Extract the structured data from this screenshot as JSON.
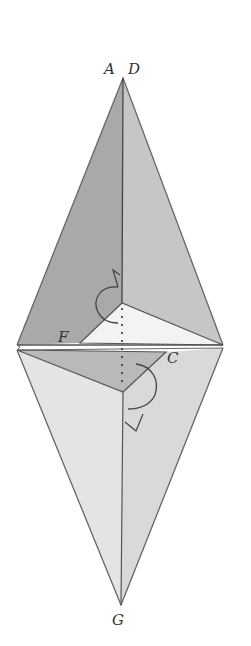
{
  "diagram": {
    "labels": {
      "A": "A",
      "D": "D",
      "F": "F",
      "C": "C",
      "G": "G"
    },
    "colors": {
      "background": "#ffffff",
      "upper_left_face": "#a9a9a9",
      "upper_right_face": "#c4c4c4",
      "lower_left_face": "#e2e2e2",
      "lower_right_face": "#d6d6d6",
      "inner_white_triangle": "#f2f2f2",
      "inner_gray_triangle": "#b8b8b8",
      "line": "#555555",
      "label": "#333333"
    },
    "points": {
      "A_D_apex": [
        123,
        78
      ],
      "left_vertex": [
        17,
        345
      ],
      "right_vertex": [
        223,
        345
      ],
      "G_apex": [
        121,
        605
      ],
      "upper_inner_point": [
        122,
        305
      ],
      "F": [
        80,
        343
      ],
      "C": [
        166,
        352
      ],
      "lower_inner_point": [
        123,
        392
      ]
    }
  }
}
